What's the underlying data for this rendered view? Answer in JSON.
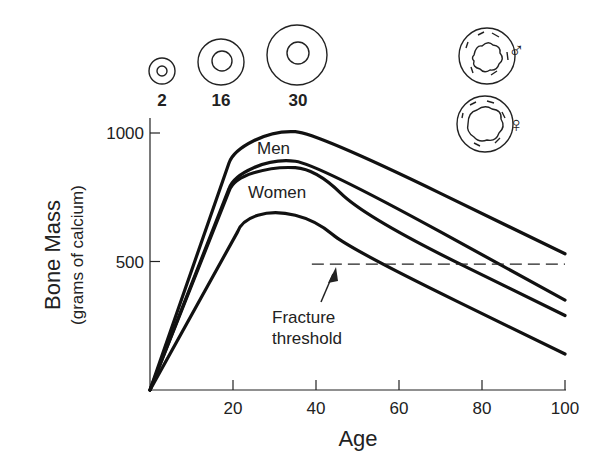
{
  "chart_data": {
    "type": "line",
    "title": "",
    "xlabel": "Age",
    "ylabel": "Bone Mass",
    "ylabel_sub": "(grams of calcium)",
    "xlim": [
      0,
      100
    ],
    "ylim": [
      0,
      1000
    ],
    "x_ticks": [
      20,
      40,
      60,
      80,
      100
    ],
    "y_ticks": [
      500,
      1000
    ],
    "grid": false,
    "series": [
      {
        "name": "Men (upper)",
        "group": "Men",
        "points": [
          [
            0,
            0
          ],
          [
            20,
            930
          ],
          [
            30,
            1010
          ],
          [
            40,
            1000
          ],
          [
            100,
            530
          ]
        ]
      },
      {
        "name": "Men (lower)",
        "group": "Men",
        "points": [
          [
            0,
            0
          ],
          [
            20,
            830
          ],
          [
            30,
            900
          ],
          [
            40,
            880
          ],
          [
            100,
            350
          ]
        ]
      },
      {
        "name": "Women (upper)",
        "group": "Women",
        "points": [
          [
            0,
            0
          ],
          [
            20,
            820
          ],
          [
            30,
            870
          ],
          [
            40,
            860
          ],
          [
            52,
            670
          ],
          [
            100,
            290
          ]
        ]
      },
      {
        "name": "Women (lower)",
        "group": "Women",
        "points": [
          [
            0,
            0
          ],
          [
            22,
            660
          ],
          [
            30,
            700
          ],
          [
            40,
            660
          ],
          [
            48,
            550
          ],
          [
            100,
            140
          ]
        ]
      }
    ],
    "threshold": {
      "label_line1": "Fracture",
      "label_line2": "threshold",
      "value": 490,
      "x_range": [
        39,
        100
      ]
    },
    "annotations": [
      {
        "text": "Men",
        "near": [
          33,
          920
        ]
      },
      {
        "text": "Women",
        "near": [
          33,
          760
        ]
      }
    ],
    "bone_cross_sections": [
      {
        "age_label": "2"
      },
      {
        "age_label": "16"
      },
      {
        "age_label": "30"
      }
    ],
    "sex_symbols": [
      {
        "symbol": "♂",
        "meaning": "male bone cross-section"
      },
      {
        "symbol": "♀",
        "meaning": "female bone cross-section"
      }
    ]
  }
}
